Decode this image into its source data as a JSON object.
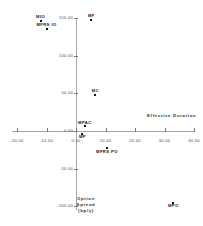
{
  "chart_data": {
    "type": "scatter",
    "title": "",
    "xlabel": "Effective  Duration",
    "ylabel": "Option\nSpread\n(bp/y)",
    "ylabel_lines": [
      "Option",
      "Spread",
      "(bp/y)"
    ],
    "xlim": [
      -20.0,
      40.0
    ],
    "ylim": [
      -100.0,
      150.0
    ],
    "xticks": [
      -20.0,
      -10.0,
      0.0,
      10.0,
      20.0,
      30.0,
      40.0
    ],
    "xtick_labels": [
      "-20.00",
      "-10.00",
      "0.00",
      "10.00",
      "20.00",
      "30.00",
      "40.00"
    ],
    "yticks": [
      -100.0,
      -50.0,
      0.0,
      50.0,
      100.0,
      150.0
    ],
    "ytick_labels": [
      "-100.00",
      "-50.00",
      "0.00",
      "50.00",
      "100.00",
      "150.00"
    ],
    "grid": false,
    "legend": false,
    "axis_style": "crosshair-at-origin",
    "points": [
      {
        "label": "MIO",
        "x": -12.0,
        "y": 146.0,
        "label_pos": "above"
      },
      {
        "label": "MFRS IO",
        "x": -10.0,
        "y": 136.0,
        "label_pos": "above"
      },
      {
        "label": "MF",
        "x": 5.2,
        "y": 148.0,
        "label_pos": "above"
      },
      {
        "label": "MC",
        "x": 6.6,
        "y": 48.0,
        "label_pos": "above"
      },
      {
        "label": "MPAC",
        "x": 3.0,
        "y": 6.0,
        "label_pos": "above"
      },
      {
        "label": "MP",
        "x": 2.2,
        "y": -3.5,
        "label_pos": "below"
      },
      {
        "label": "MFRS PO",
        "x": 10.5,
        "y": -23.0,
        "label_pos": "below"
      },
      {
        "label": "MPO",
        "x": 33.0,
        "y": -95.0,
        "label_pos": "below"
      }
    ]
  }
}
